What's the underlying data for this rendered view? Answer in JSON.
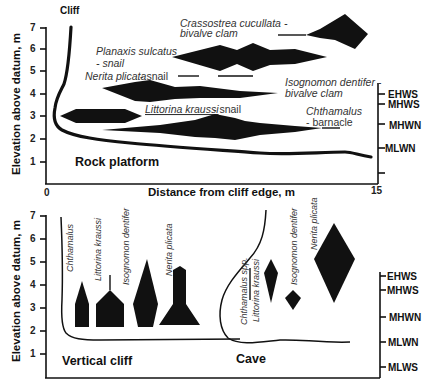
{
  "top_panel": {
    "y_axis_title": "Elevation above datum, m",
    "y_ticks": [
      "1",
      "2",
      "3",
      "4",
      "5",
      "6",
      "7"
    ],
    "x_axis_title": "Distance from cliff edge, m",
    "x_ticks": [
      "0",
      "15"
    ],
    "cliff_label": "Cliff",
    "region_label": "Rock platform",
    "tide_levels": [
      "EHWS",
      "MHWS",
      "MHWN",
      "MLWN"
    ],
    "species": [
      {
        "id": "crassostrea",
        "name": "Crassostrea cucullata -",
        "desc": "bivalve clam"
      },
      {
        "id": "planaxis",
        "name": "Planaxis sulcatus",
        "desc": "- snail"
      },
      {
        "id": "nerita",
        "name": "Nerita plicata",
        "desc": " - snail"
      },
      {
        "id": "isognomon",
        "name": "Isognomon dentifer -",
        "desc": "bivalve clam"
      },
      {
        "id": "littorina",
        "name": "Littorina kraussi",
        "desc": " - snail"
      },
      {
        "id": "chthamalus",
        "name": "Chthamalus",
        "desc": "- barnacle"
      }
    ]
  },
  "bottom_panel": {
    "y_axis_title": "Elevation above datum, m",
    "y_ticks": [
      "1",
      "2",
      "3",
      "4",
      "5",
      "6",
      "7"
    ],
    "tide_levels": [
      "EHWS",
      "MHWS",
      "MHWN",
      "MLWN",
      "MLWS"
    ],
    "cliff": {
      "region_label": "Vertical cliff",
      "species": [
        "Chthamalus",
        "Littorina kraussi",
        "Isognomon dentifer",
        "Nerita plicata"
      ]
    },
    "cave": {
      "region_label": "Cave",
      "species": [
        "Chthamalus spp.",
        "Littorina kraussi",
        "Isognomon dentifer",
        "Nerita plicata"
      ]
    }
  }
}
